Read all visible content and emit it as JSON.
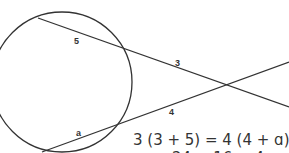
{
  "diagram": {
    "circle": {
      "cx": 62,
      "cy": 82,
      "r": 70,
      "stroke": "#333333"
    },
    "secants": [
      {
        "name": "top-secant",
        "points": [
          [
            38,
            18
          ],
          [
            128,
            50
          ],
          [
            228,
            85
          ],
          [
            289,
            107
          ]
        ],
        "external_label": "3",
        "internal_label": "5"
      },
      {
        "name": "bottom-secant",
        "points": [
          [
            42,
            152
          ],
          [
            125,
            121
          ],
          [
            228,
            85
          ],
          [
            289,
            62
          ]
        ],
        "external_label": "4",
        "internal_label": "a"
      }
    ],
    "labels": {
      "top_internal": "5",
      "top_external": "3",
      "bottom_external": "4",
      "bottom_internal": "a"
    },
    "equation": {
      "line1": "3 (3 + 5) = 4 (4 + ɑ)",
      "line2": "24 = 16 + 4ɑ"
    },
    "colors": {
      "line": "#333333",
      "text": "#333333",
      "background": "#ffffff"
    }
  }
}
